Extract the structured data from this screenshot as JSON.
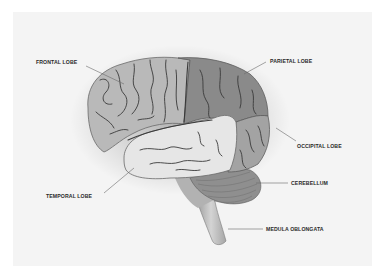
{
  "diagram": {
    "type": "anatomy-illustration",
    "labels": [
      {
        "id": "frontal",
        "text": "FRONTAL LOBE",
        "x": 36,
        "y": 62
      },
      {
        "id": "parietal",
        "text": "PARIETAL LOBE",
        "x": 270,
        "y": 59
      },
      {
        "id": "occipital",
        "text": "OCCIPITAL LOBE",
        "x": 297,
        "y": 143
      },
      {
        "id": "temporal",
        "text": "TEMPORAL LOBE",
        "x": 46,
        "y": 194
      },
      {
        "id": "cerebellum",
        "text": "CEREBELLUM",
        "x": 291,
        "y": 181
      },
      {
        "id": "medulla",
        "text": "MEDULA OBLONGATA",
        "x": 266,
        "y": 227
      }
    ],
    "colors": {
      "background": "#ffffff",
      "panel": "#f4f4f4",
      "frontal_lobe": "#b9b9b9",
      "parietal_lobe": "#8a8a8a",
      "occipital_lobe": "#a3a3a3",
      "temporal_lobe": "#e6e6e6",
      "cerebellum": "#8f8f8f",
      "brainstem": "#bdbdbd",
      "sulci": "#3a3a3a",
      "label_text": "#2a2a2a",
      "leader_line": "#6a6a6a"
    }
  }
}
